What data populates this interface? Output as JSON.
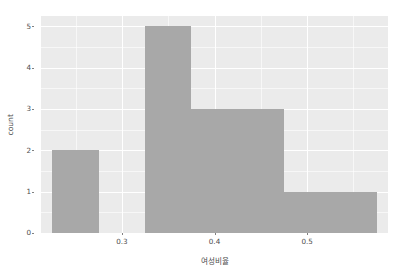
{
  "chart_data": {
    "type": "bar",
    "title": "",
    "subtitle": "",
    "xlabel": "여성비율",
    "ylabel": "count",
    "xlim": [
      0.2127,
      0.5873
    ],
    "ylim": [
      0,
      5.25
    ],
    "binwidth": 0.05,
    "grid": true,
    "legend": null,
    "theme": "ggplot2-grey",
    "panel_background": "#ebebeb",
    "gridline_color": "#ffffff",
    "bar_color": "#a8a8a8",
    "axis_text_color": "#4d4d4d",
    "x_ticks": [
      {
        "value": 0.3,
        "label": "0.3"
      },
      {
        "value": 0.4,
        "label": "0.4"
      },
      {
        "value": 0.5,
        "label": "0.5"
      }
    ],
    "x_minor_ticks": [
      0.25,
      0.35,
      0.45,
      0.55
    ],
    "y_ticks": [
      {
        "value": 0,
        "label": "0"
      },
      {
        "value": 1,
        "label": "1"
      },
      {
        "value": 2,
        "label": "2"
      },
      {
        "value": 3,
        "label": "3"
      },
      {
        "value": 4,
        "label": "4"
      },
      {
        "value": 5,
        "label": "5"
      }
    ],
    "y_minor_ticks": [
      0.5,
      1.5,
      2.5,
      3.5,
      4.5
    ],
    "bins": [
      {
        "x0": 0.225,
        "x1": 0.275,
        "count": 2
      },
      {
        "x0": 0.325,
        "x1": 0.375,
        "count": 5
      },
      {
        "x0": 0.375,
        "x1": 0.425,
        "count": 3
      },
      {
        "x0": 0.425,
        "x1": 0.475,
        "count": 3
      },
      {
        "x0": 0.475,
        "x1": 0.525,
        "count": 1
      },
      {
        "x0": 0.525,
        "x1": 0.575,
        "count": 1
      }
    ],
    "categories": [
      "0.225-0.275",
      "0.325-0.375",
      "0.375-0.425",
      "0.425-0.475",
      "0.475-0.525",
      "0.525-0.575"
    ],
    "values": [
      2,
      5,
      3,
      3,
      1,
      1
    ]
  }
}
